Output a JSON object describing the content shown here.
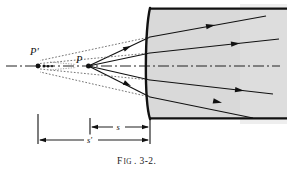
{
  "figure": {
    "caption_prefix": "F",
    "caption_small": "IG",
    "caption_rest": ". 3-2.",
    "caption_full": "FIG. 3-2.",
    "colors": {
      "ink": "#111111",
      "glass_fill": "#d9d9d9",
      "glass_edge": "#111111",
      "dotted_ray": "#555555",
      "axis": "#222222",
      "background": "#ffffff"
    },
    "labels": {
      "virtual_image_point": "P'",
      "object_point": "P",
      "object_distance": "s",
      "image_distance": "s'"
    },
    "geometry": {
      "axis_y": 66,
      "point_P_x": 88,
      "point_P_y": 66,
      "point_Pprime_x": 38,
      "point_Pprime_y": 66,
      "vertex_x": 150,
      "glass_top_y": 8,
      "glass_bottom_y": 119,
      "glass_right_x": 287,
      "surface_bulge": 6,
      "dim_tick_left_x": 38,
      "dim_tick_mid_x": 90,
      "dim_tick_right_x": 150,
      "dim_s_y": 126,
      "dim_sprime_y": 140
    },
    "rays": [
      {
        "name": "ray-upper-outer",
        "from": [
          88,
          66
        ],
        "to": [
          150,
          37
        ],
        "exit_to": [
          265,
          16
        ]
      },
      {
        "name": "ray-upper-inner",
        "from": [
          88,
          66
        ],
        "to": [
          150,
          53
        ],
        "exit_to": [
          278,
          39
        ]
      },
      {
        "name": "ray-axial",
        "from": [
          88,
          66
        ],
        "to": [
          150,
          66
        ],
        "exit_to": [
          278,
          66
        ]
      },
      {
        "name": "ray-lower-inner",
        "from": [
          88,
          66
        ],
        "to": [
          150,
          80
        ],
        "exit_to": [
          272,
          94
        ]
      },
      {
        "name": "ray-lower-outer",
        "from": [
          88,
          66
        ],
        "to": [
          150,
          97
        ],
        "exit_to": [
          252,
          118
        ]
      }
    ],
    "dotted_extensions": [
      {
        "name": "dotted-upper-outer",
        "from": [
          150,
          37
        ],
        "to": [
          40,
          60
        ]
      },
      {
        "name": "dotted-upper-inner",
        "from": [
          150,
          53
        ],
        "to": [
          40,
          63
        ]
      },
      {
        "name": "dotted-lower-inner",
        "from": [
          150,
          80
        ],
        "to": [
          40,
          70
        ]
      },
      {
        "name": "dotted-lower-outer",
        "from": [
          150,
          97
        ],
        "to": [
          40,
          73
        ]
      }
    ]
  }
}
